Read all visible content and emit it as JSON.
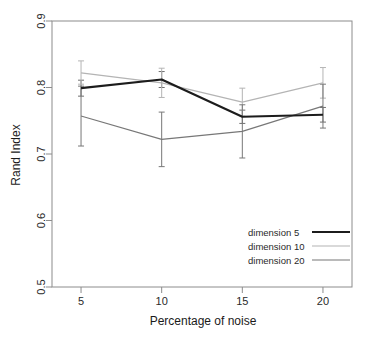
{
  "chart_data": {
    "type": "line",
    "title": "",
    "subtitle": "",
    "xlabel": "Percentage of noise",
    "ylabel": "Rand Index",
    "x": [
      5,
      10,
      15,
      20
    ],
    "xticklabels": [
      "5",
      "10",
      "15",
      "20"
    ],
    "yticks": [
      0.5,
      0.6,
      0.7,
      0.8,
      0.9
    ],
    "yticklabels": [
      "0.5",
      "0.6",
      "0.7",
      "0.8",
      "0.9"
    ],
    "xlim": [
      3.2,
      21.8
    ],
    "ylim": [
      0.5,
      0.9
    ],
    "grid": false,
    "legend_position": "bottom-right",
    "error_bars": "vertical",
    "series": [
      {
        "name": "dimension  5",
        "color": "#1c1c1c",
        "width": 2.2,
        "values": [
          0.799,
          0.812,
          0.756,
          0.759
        ],
        "err_low": [
          0.787,
          0.8,
          0.746,
          0.748
        ],
        "err_high": [
          0.811,
          0.824,
          0.766,
          0.77
        ]
      },
      {
        "name": "dimension 10",
        "color": "#b4b4b4",
        "width": 1.1,
        "values": [
          0.822,
          0.807,
          0.778,
          0.807
        ],
        "err_low": [
          0.805,
          0.785,
          0.757,
          0.784
        ],
        "err_high": [
          0.84,
          0.829,
          0.799,
          0.83
        ]
      },
      {
        "name": "dimension 20",
        "color": "#777777",
        "width": 1.1,
        "values": [
          0.757,
          0.722,
          0.734,
          0.772
        ],
        "err_low": [
          0.712,
          0.681,
          0.694,
          0.739
        ],
        "err_high": [
          0.802,
          0.763,
          0.774,
          0.805
        ]
      }
    ]
  },
  "legend": {
    "entries": [
      {
        "label": "dimension  5"
      },
      {
        "label": "dimension 10"
      },
      {
        "label": "dimension 20"
      }
    ]
  },
  "axes": {
    "x_title": "Percentage of noise",
    "y_title": "Rand Index",
    "x_ticks": [
      "5",
      "10",
      "15",
      "20"
    ],
    "y_ticks": [
      "0.5",
      "0.6",
      "0.7",
      "0.8",
      "0.9"
    ]
  }
}
